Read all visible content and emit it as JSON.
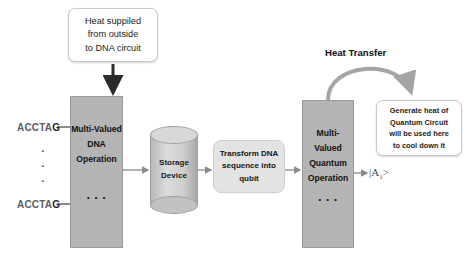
{
  "diagram": {
    "colors": {
      "process_box": "#b4b4b4",
      "transform_box": "#e3e3e3",
      "cylinder": "#d8d8d8",
      "callout_bg": "#ffffff",
      "connector": "#8a8a8a",
      "background": "#ffffff"
    },
    "callouts": {
      "heat_input": "Heat suppiled\nfrom outside\nto DNA circuit",
      "quantum_heat": "Generate heat of\nQuantum Circuit\nwill be used here\nto cool down it"
    },
    "nodes": {
      "dna_operation": "Multi-Valued\nDNA\nOperation",
      "quantum_operation": "Multi-Valued\nQuantum\nOperation",
      "storage_device": "Storage\nDevice",
      "transform": "Transform DNA\nsequence into\nqubit"
    },
    "labels": {
      "heat_transfer": "Heat Transfer",
      "output_ket_prefix": "|A",
      "output_ket_sub": "1",
      "output_ket_suffix": ">"
    },
    "inputs": {
      "sequence_top_head": "ACCTA",
      "sequence_top_tail": "G",
      "sequence_bottom_head": "ACCTA",
      "sequence_bottom_tail": "G",
      "vertical_dots": "·\n·\n·"
    },
    "box_dots": "·\n·\n·"
  }
}
